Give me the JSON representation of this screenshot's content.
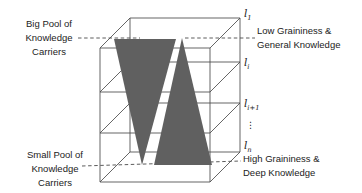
{
  "diagram_title": "knowledge-levels-box",
  "colors": {
    "line": "#4a4a4a",
    "triangle_fill": "#606060",
    "text": "#222222",
    "background": "#ffffff"
  },
  "annotations": {
    "big_pool": {
      "lines": [
        "Big Pool of",
        "Knowledge",
        "Carriers"
      ]
    },
    "small_pool": {
      "lines": [
        "Small Pool of",
        "Knowledge",
        "Carriers"
      ]
    },
    "low_graininess": {
      "lines": [
        "Low Graininess &",
        "General Knowledge"
      ]
    },
    "high_graininess": {
      "lines": [
        "High Graininess &",
        "Deep Knowledge"
      ]
    }
  },
  "levels": {
    "l1": {
      "base": "l",
      "sub": "1"
    },
    "li": {
      "base": "l",
      "sub": "i"
    },
    "li1": {
      "base": "l",
      "sub": "i+1"
    },
    "dots": "⋮",
    "ln": {
      "base": "l",
      "sub": "n"
    }
  }
}
